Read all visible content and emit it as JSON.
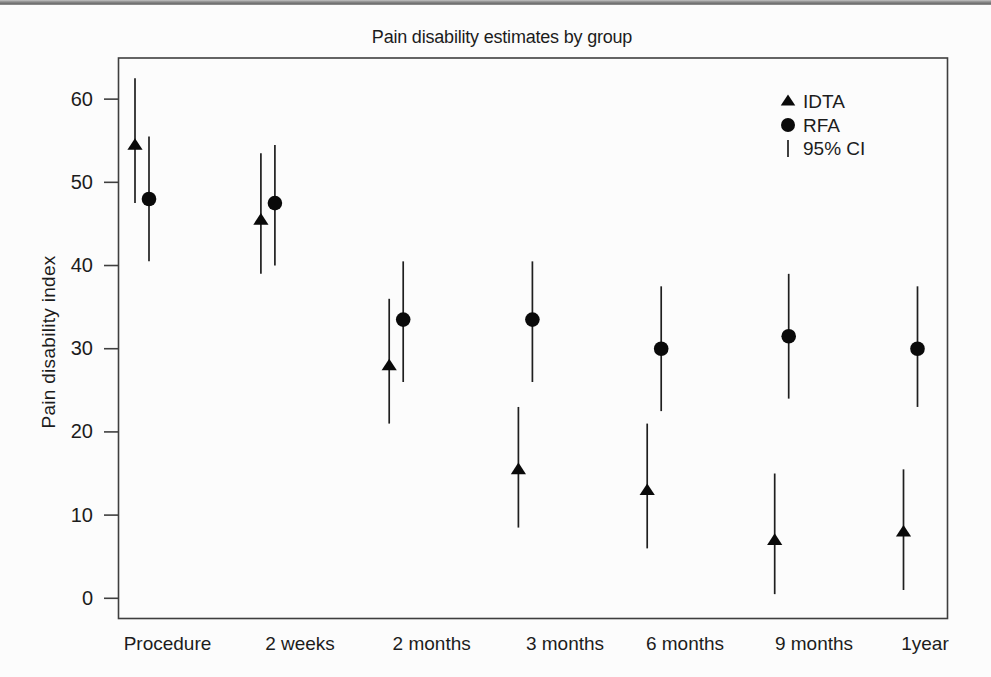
{
  "page": {
    "background": "#fcfcfc"
  },
  "colors": {
    "marker": "#0a0a0a",
    "ci_line": "#1f1f1f",
    "frame": "#3f3f3f",
    "text": "#1c1c1c",
    "top_rule": "#6e6e6e"
  },
  "chart_data": {
    "type": "scatter",
    "title": "Pain disability estimates by group",
    "xlabel": "",
    "ylabel": "Pain disability index",
    "categories": [
      "Procedure",
      "2 weeks",
      "2 months",
      "3 months",
      "6 months",
      "9 months",
      "1year"
    ],
    "yticks": [
      0,
      10,
      20,
      30,
      40,
      50,
      60
    ],
    "ylim": [
      -2.5,
      65
    ],
    "grid": false,
    "error_bars": "95% CI",
    "legend": {
      "position": "top-right",
      "entries": [
        {
          "marker": "triangle",
          "label": "IDTA"
        },
        {
          "marker": "circle",
          "label": "RFA"
        },
        {
          "marker": "vline",
          "label": "95% CI"
        }
      ]
    },
    "series": [
      {
        "name": "IDTA",
        "marker": "triangle",
        "values": [
          54.5,
          45.5,
          28,
          15.5,
          13,
          7,
          8
        ],
        "ci_low": [
          47.5,
          39,
          21,
          8.5,
          6,
          0.5,
          1
        ],
        "ci_high": [
          62.5,
          53.5,
          36,
          23,
          21,
          15,
          15.5
        ]
      },
      {
        "name": "RFA",
        "marker": "circle",
        "values": [
          48,
          47.5,
          33.5,
          33.5,
          30,
          31.5,
          30
        ],
        "ci_low": [
          40.5,
          40,
          26,
          26,
          22.5,
          24,
          23
        ],
        "ci_high": [
          55.5,
          54.5,
          40.5,
          40.5,
          37.5,
          39,
          37.5
        ]
      }
    ]
  }
}
